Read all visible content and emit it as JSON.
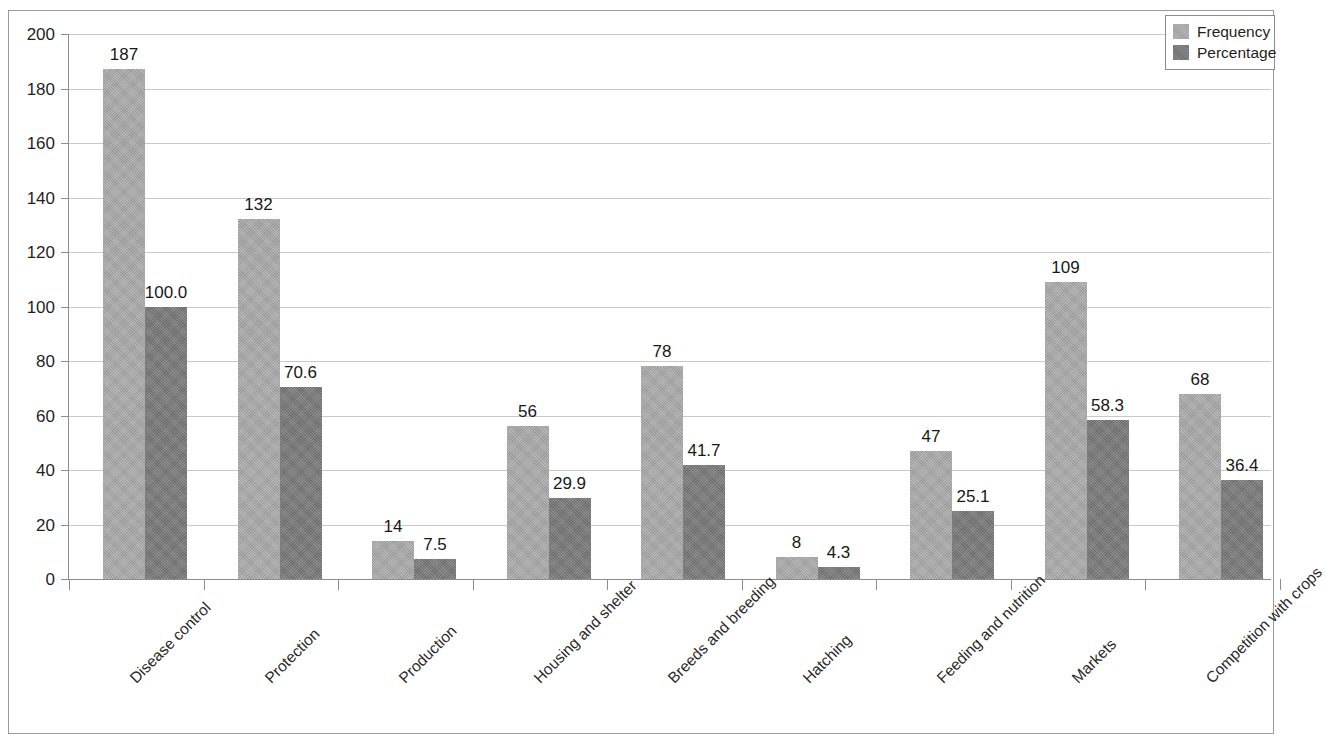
{
  "chart_data": {
    "type": "bar",
    "title": "",
    "subtitle": "",
    "xlabel": "",
    "ylabel": "",
    "ylim": [
      0,
      200
    ],
    "ytick_step": 20,
    "yticks": [
      "200",
      "180",
      "160",
      "140",
      "120",
      "100",
      "80",
      "60",
      "40",
      "20",
      "0"
    ],
    "grid": true,
    "legend_position": "top-right",
    "categories": [
      "Disease control",
      "Protection",
      "Production",
      "Housing and shelter",
      "Breeds and breeding",
      "Hatching",
      "Feeding and nutrition",
      "Markets",
      "Competition with crops"
    ],
    "series": [
      {
        "name": "Frequency",
        "color": "#aaaaaa",
        "values": [
          187,
          132,
          14,
          56,
          78,
          8,
          47,
          109,
          68
        ],
        "labels": [
          "187",
          "132",
          "14",
          "56",
          "78",
          "8",
          "47",
          "109",
          "68"
        ]
      },
      {
        "name": "Percentage",
        "color": "#787878",
        "values": [
          100.0,
          70.6,
          7.5,
          29.9,
          41.7,
          4.3,
          25.1,
          58.3,
          36.4
        ],
        "labels": [
          "100.0",
          "70.6",
          "7.5",
          "29.9",
          "41.7",
          "4.3",
          "25.1",
          "58.3",
          "36.4"
        ]
      }
    ]
  },
  "legend": {
    "items": [
      {
        "label": "Frequency",
        "swatch": "freq"
      },
      {
        "label": "Percentage",
        "swatch": "pct"
      }
    ]
  }
}
